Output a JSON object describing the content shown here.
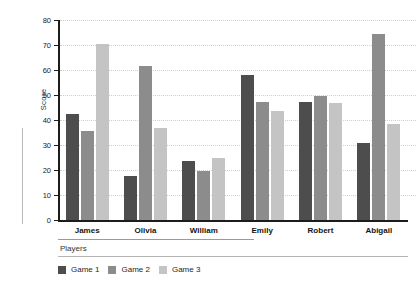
{
  "chart_data": {
    "type": "bar",
    "title": "",
    "xlabel": "Players",
    "ylabel": "Score",
    "categories": [
      "James",
      "Olivia",
      "William",
      "Emily",
      "Robert",
      "Abigail"
    ],
    "series": [
      {
        "name": "Game 1",
        "color": "#4d4d4d",
        "values": [
          42.5,
          17.5,
          23.8,
          58.0,
          47.2,
          31.0
        ]
      },
      {
        "name": "Game 2",
        "color": "#8c8c8c",
        "values": [
          35.5,
          61.5,
          19.7,
          47.2,
          49.8,
          74.5
        ]
      },
      {
        "name": "Game 3",
        "color": "#c4c4c4",
        "values": [
          70.5,
          36.8,
          24.8,
          43.5,
          47.0,
          38.5
        ]
      }
    ],
    "ylim": [
      0,
      80
    ],
    "yticks": [
      0,
      10,
      20,
      30,
      40,
      50,
      60,
      70,
      80
    ],
    "ytick_labels": [
      "0",
      "10",
      "20",
      "30",
      "40",
      "50",
      "60",
      "70",
      "80"
    ],
    "grid": true,
    "grid_style": "dotted",
    "legend_position": "bottom-left",
    "background": "#ffffff"
  }
}
